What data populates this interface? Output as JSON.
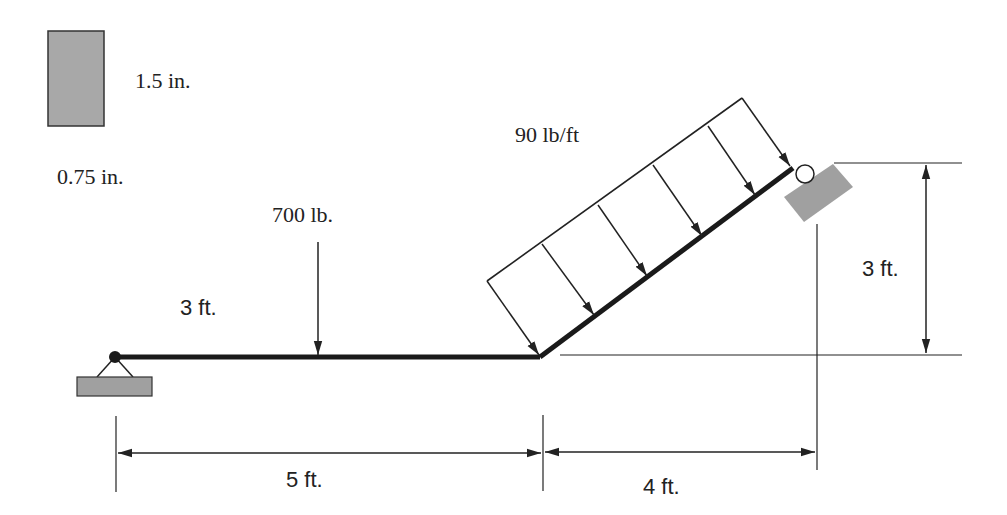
{
  "cross_section": {
    "height_label": "1.5 in.",
    "width_label": "0.75 in.",
    "fill_color": "#a8a8a8"
  },
  "loads": {
    "point_load_label": "700 lb.",
    "point_load_position_label": "3 ft.",
    "distributed_load_label": "90 lb/ft"
  },
  "dimensions": {
    "horizontal_span_1": "5 ft.",
    "horizontal_span_2": "4 ft.",
    "vertical_rise": "3 ft."
  },
  "supports": {
    "left": "pin-support",
    "right": "roller-support"
  },
  "colors": {
    "beam": "#1a1a1a",
    "support_fill": "#a0a0a0",
    "line": "#222222"
  }
}
